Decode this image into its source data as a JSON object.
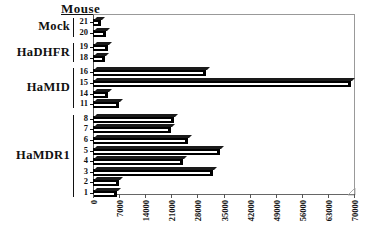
{
  "chart_data": {
    "type": "bar",
    "orientation": "horizontal",
    "title": "Mouse",
    "xlabel": "",
    "ylabel": "",
    "xlim": [
      0,
      70000
    ],
    "xticks": [
      0,
      7000,
      14000,
      21000,
      28000,
      35000,
      42000,
      49000,
      56000,
      63000,
      70000
    ],
    "xticklabels": [
      "0",
      "7000",
      "14000",
      "21000",
      "28000",
      "35000",
      "42000",
      "49000",
      "56000",
      "63000",
      "70000"
    ],
    "grid": false,
    "legend": false,
    "categories": [
      "21",
      "20",
      "19",
      "18",
      "16",
      "15",
      "14",
      "11",
      "8",
      "7",
      "6",
      "5",
      "4",
      "3",
      "2",
      "1"
    ],
    "values": [
      2100,
      3600,
      3900,
      3300,
      30200,
      69200,
      4000,
      7100,
      21600,
      21000,
      25600,
      34100,
      24100,
      32100,
      7100,
      6500
    ],
    "groups": [
      {
        "label": "Mock",
        "categories": [
          "21",
          "20"
        ]
      },
      {
        "label": "HaDHFR",
        "categories": [
          "19",
          "18"
        ]
      },
      {
        "label": "HaMID",
        "categories": [
          "16",
          "15",
          "14",
          "11"
        ]
      },
      {
        "label": "HaMDR1",
        "categories": [
          "8",
          "7",
          "6",
          "5",
          "4",
          "3",
          "2",
          "1"
        ]
      }
    ],
    "bar_color": "#000000",
    "background_color": "#ffffff"
  }
}
